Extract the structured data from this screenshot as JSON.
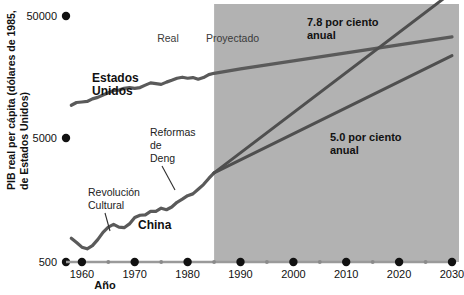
{
  "chart_data": {
    "type": "line",
    "title": "",
    "xlabel": "Año",
    "ylabel": "PIB real per cápita (dólares de 1985, de Estados Unidos)",
    "ylabel_line1": "PIB real per cápita (dólares de 1985,",
    "ylabel_line2": "de Estados Unidos)",
    "yscale": "log",
    "ylim": [
      500,
      50000
    ],
    "xlim": [
      1957,
      2030
    ],
    "grid": false,
    "legend": "none",
    "y_ticks": [
      {
        "value": 500,
        "label": "500"
      },
      {
        "value": 5000,
        "label": "5000"
      },
      {
        "value": 50000,
        "label": "50000"
      }
    ],
    "x_ticks_major": [
      {
        "value": 1960,
        "label": "1960"
      },
      {
        "value": 1970,
        "label": "1970"
      },
      {
        "value": 1980,
        "label": "1980"
      },
      {
        "value": 1990,
        "label": "1990"
      },
      {
        "value": 2000,
        "label": "2000"
      },
      {
        "value": 2010,
        "label": "2010"
      },
      {
        "value": 2020,
        "label": "2020"
      },
      {
        "value": 2030,
        "label": "2030"
      }
    ],
    "x_ticks_minor": [
      1965,
      1975,
      1985,
      1995,
      2005,
      2015,
      2025
    ],
    "regions": [
      {
        "name": "real",
        "label": "Real",
        "x_start": 1957,
        "x_end": 1985,
        "shaded": false
      },
      {
        "name": "proyectado",
        "label": "Proyectado",
        "x_start": 1985,
        "x_end": 2030,
        "shaded": true
      }
    ],
    "series": [
      {
        "name": "Estados Unidos",
        "label": "Estados Unidos",
        "label_line1": "Estados",
        "label_line2": "Unidos",
        "kind": "historical+projection",
        "points": [
          {
            "x": 1958,
            "y": 9400
          },
          {
            "x": 1959,
            "y": 9900
          },
          {
            "x": 1960,
            "y": 10000
          },
          {
            "x": 1961,
            "y": 10100
          },
          {
            "x": 1962,
            "y": 10600
          },
          {
            "x": 1963,
            "y": 10900
          },
          {
            "x": 1964,
            "y": 11400
          },
          {
            "x": 1965,
            "y": 11900
          },
          {
            "x": 1966,
            "y": 12400
          },
          {
            "x": 1967,
            "y": 12500
          },
          {
            "x": 1968,
            "y": 12900
          },
          {
            "x": 1969,
            "y": 13100
          },
          {
            "x": 1970,
            "y": 12900
          },
          {
            "x": 1971,
            "y": 13100
          },
          {
            "x": 1972,
            "y": 13700
          },
          {
            "x": 1973,
            "y": 14300
          },
          {
            "x": 1974,
            "y": 14100
          },
          {
            "x": 1975,
            "y": 13900
          },
          {
            "x": 1976,
            "y": 14500
          },
          {
            "x": 1977,
            "y": 15000
          },
          {
            "x": 1978,
            "y": 15600
          },
          {
            "x": 1979,
            "y": 15900
          },
          {
            "x": 1980,
            "y": 15600
          },
          {
            "x": 1981,
            "y": 15800
          },
          {
            "x": 1982,
            "y": 15300
          },
          {
            "x": 1983,
            "y": 15800
          },
          {
            "x": 1984,
            "y": 16700
          },
          {
            "x": 1985,
            "y": 17100
          },
          {
            "x": 1990,
            "y": 18600
          },
          {
            "x": 2000,
            "y": 21600
          },
          {
            "x": 2010,
            "y": 25100
          },
          {
            "x": 2020,
            "y": 29100
          },
          {
            "x": 2030,
            "y": 33800
          }
        ]
      },
      {
        "name": "China",
        "label": "China",
        "kind": "historical",
        "points": [
          {
            "x": 1958,
            "y": 780
          },
          {
            "x": 1959,
            "y": 720
          },
          {
            "x": 1960,
            "y": 660
          },
          {
            "x": 1961,
            "y": 640
          },
          {
            "x": 1962,
            "y": 680
          },
          {
            "x": 1963,
            "y": 760
          },
          {
            "x": 1964,
            "y": 870
          },
          {
            "x": 1965,
            "y": 960
          },
          {
            "x": 1966,
            "y": 1010
          },
          {
            "x": 1967,
            "y": 960
          },
          {
            "x": 1968,
            "y": 950
          },
          {
            "x": 1969,
            "y": 1020
          },
          {
            "x": 1970,
            "y": 1150
          },
          {
            "x": 1971,
            "y": 1200
          },
          {
            "x": 1972,
            "y": 1210
          },
          {
            "x": 1973,
            "y": 1290
          },
          {
            "x": 1974,
            "y": 1290
          },
          {
            "x": 1975,
            "y": 1370
          },
          {
            "x": 1976,
            "y": 1330
          },
          {
            "x": 1977,
            "y": 1400
          },
          {
            "x": 1978,
            "y": 1530
          },
          {
            "x": 1979,
            "y": 1620
          },
          {
            "x": 1980,
            "y": 1730
          },
          {
            "x": 1981,
            "y": 1790
          },
          {
            "x": 1982,
            "y": 1950
          },
          {
            "x": 1983,
            "y": 2130
          },
          {
            "x": 1984,
            "y": 2390
          },
          {
            "x": 1985,
            "y": 2650
          }
        ]
      },
      {
        "name": "China proyección alta",
        "label": "7.8 por ciento anual",
        "label_line1": "7.8 por ciento",
        "label_line2": "anual",
        "kind": "projection",
        "growth_rate_pct": 7.8,
        "points": [
          {
            "x": 1985,
            "y": 2650
          },
          {
            "x": 2030,
            "y": 78000
          }
        ]
      },
      {
        "name": "China proyección baja",
        "label": "5.0 por ciento anual",
        "label_line1": "5.0 por ciento",
        "label_line2": "anual",
        "kind": "projection",
        "growth_rate_pct": 5.0,
        "points": [
          {
            "x": 1985,
            "y": 2650
          },
          {
            "x": 2030,
            "y": 23800
          }
        ]
      }
    ],
    "annotations": [
      {
        "name": "revolucion-cultural",
        "label": "Revolución Cultural",
        "line1": "Revolución",
        "line2": "Cultural",
        "target_x": 1967,
        "target_y": 960
      },
      {
        "name": "reformas-de-deng",
        "label": "Reformas de Deng",
        "line1": "Reformas",
        "line2": "de",
        "line3": "Deng",
        "target_x": 1979,
        "target_y": 1620
      }
    ],
    "colors": {
      "background": "#ffffff",
      "shaded_region": "#b0b0b0",
      "line": "#595959",
      "text": "#111111",
      "axis": "#8a8a8a"
    }
  }
}
